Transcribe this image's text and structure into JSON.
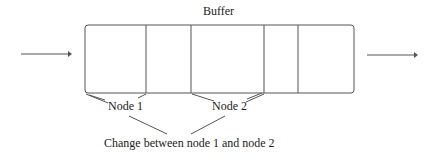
{
  "title": "Buffer",
  "nodes": [
    {
      "label": "Node 1"
    },
    {
      "label": "Node 2"
    }
  ],
  "caption": "Change between node 1 and node 2",
  "colors": {
    "stroke": "#555555",
    "text": "#222222"
  }
}
